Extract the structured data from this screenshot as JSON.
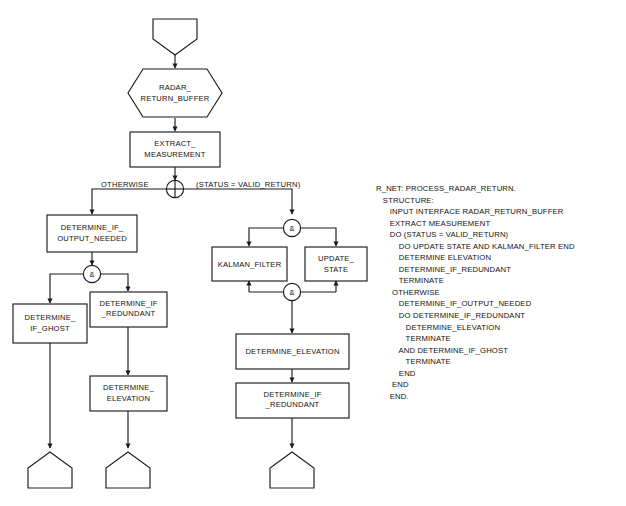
{
  "diagram": {
    "colors": {
      "background": "#ffffff",
      "stroke": "#1c1c1c",
      "text": "#111111"
    },
    "nodes": {
      "start_terminator": "",
      "radar_return_buffer": "RADAR_\nRETURN_BUFFER",
      "radar_return_buffer_line1": "RADAR_",
      "radar_return_buffer_line2": "RETURN_BUFFER",
      "extract_measurement_line1": "EXTRACT_",
      "extract_measurement_line2": "MEASUREMENT",
      "determine_if_output_needed_line1": "DETERMINE_IF_",
      "determine_if_output_needed_line2": "OUTPUT_NEEDED",
      "determine_if_ghost_line1": "DETERMINE_",
      "determine_if_ghost_line2": "IF_GHOST",
      "determine_if_redundant_left_line1": "DETERMINE_IF",
      "determine_if_redundant_left_line2": "_REDUNDANT",
      "determine_elevation_left_line1": "DETERMINE_",
      "determine_elevation_left_line2": "ELEVATION",
      "kalman_filter": "KALMAN_FILTER",
      "update_state_line1": "UPDATE_",
      "update_state_line2": "STATE",
      "determine_elevation_right": "DETERMINE_ELEVATION",
      "determine_if_redundant_right_line1": "DETERMINE_IF",
      "determine_if_redundant_right_line2": "_REDUNDANT"
    },
    "edge_labels": {
      "otherwise": "OTHERWISE",
      "valid_return": "(STATUS = VALID_RETURN)"
    },
    "junctions": {
      "selection": "selection-node",
      "and_glyph": "&"
    }
  },
  "pseudocode": {
    "lines": [
      "R_NET: PROCESS_RADAR_RETURN.",
      "   STRUCTURE:",
      "      INPUT INTERFACE RADAR_RETURN_BUFFER",
      "      EXTRACT MEASUREMENT",
      "      DO (STATUS = VALID_RETURN)",
      "          DO UPDATE STATE AND KALMAN_FILTER END",
      "          DETERMINE ELEVATION",
      "          DETERMINE_IF_REDUNDANT",
      "          TERMINATE",
      "       OTHERWISE",
      "          DETERMINE_IF_OUTPUT_NEEDED",
      "          DO DETERMINE_IF_REDUNDANT",
      "             DETERMINE_ELEVATION",
      "             TERMINATE",
      "          AND DETERMINE_IF_GHOST",
      "             TERMINATE",
      "          END",
      "       END",
      "      END."
    ]
  }
}
